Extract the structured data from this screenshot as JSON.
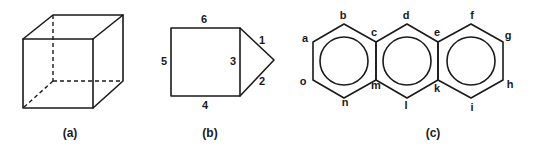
{
  "figure": {
    "panels": [
      {
        "id": "a",
        "caption": "(a)",
        "description": "Wireframe cube with hidden edges dashed"
      },
      {
        "id": "b",
        "caption": "(b)",
        "description": "Square with triangle attached on right side; edges numbered",
        "edge_labels": {
          "top": "6",
          "left": "5",
          "shared": "3",
          "bottom": "4",
          "triangle_upper": "1",
          "triangle_lower": "2"
        }
      },
      {
        "id": "c",
        "caption": "(c)",
        "description": "Three fused hexagonal rings (anthracene-like) with inscribed circles; vertices lettered",
        "vertex_labels": {
          "a": "a",
          "b": "b",
          "c": "c",
          "d": "d",
          "e": "e",
          "f": "f",
          "g": "g",
          "h": "h",
          "i": "i",
          "k": "k",
          "l": "l",
          "m": "m",
          "n": "n",
          "o": "o"
        }
      }
    ]
  }
}
